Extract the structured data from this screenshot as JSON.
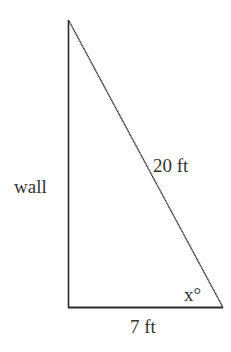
{
  "diagram": {
    "type": "right-triangle",
    "labels": {
      "left_side": "wall",
      "hypotenuse": "20 ft",
      "base": "7 ft",
      "angle": "x°"
    },
    "colors": {
      "line": "#2a2a2a",
      "text": "#333333",
      "background": "#ffffff"
    }
  }
}
